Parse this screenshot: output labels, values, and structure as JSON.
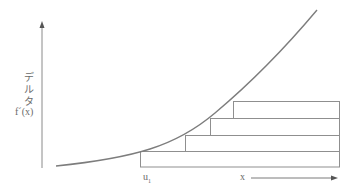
{
  "diagram": {
    "y_axis": {
      "label_chars": [
        "デ",
        "ル",
        "タ"
      ],
      "function_label": "f´(x)"
    },
    "x_axis": {
      "start_label": "u",
      "start_subscript": "1",
      "direction_label": "x"
    },
    "steps": [
      {
        "left": 140,
        "top": 151
      },
      {
        "left": 185,
        "top": 135
      },
      {
        "left": 210,
        "top": 118
      },
      {
        "left": 233,
        "top": 101
      }
    ],
    "steps_right_edge": 340,
    "steps_bottom": 167,
    "colors": {
      "line": "#8a8a8a",
      "curve": "#808080",
      "text": "#6a6a6a"
    }
  }
}
